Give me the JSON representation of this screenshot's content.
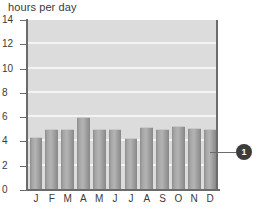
{
  "chart_data": {
    "type": "bar",
    "title": "hours per day",
    "xlabel": "",
    "ylabel": "",
    "categories": [
      "J",
      "F",
      "M",
      "A",
      "M",
      "J",
      "J",
      "A",
      "S",
      "O",
      "N",
      "D"
    ],
    "values": [
      4.4,
      5.0,
      5.0,
      6.0,
      5.0,
      5.0,
      4.3,
      5.2,
      5.0,
      5.3,
      5.1,
      5.0
    ],
    "ylim": [
      0,
      14
    ],
    "yticks": [
      0,
      2,
      4,
      6,
      8,
      10,
      12,
      14
    ],
    "ytick_labels": [
      "0",
      "2",
      "4",
      "6",
      "8",
      "10",
      "12",
      "14"
    ],
    "grid": true,
    "grid_orientation": "horizontal",
    "legend": null,
    "annotations": [
      {
        "name": "callout-badge",
        "label": "1",
        "target_category": "D",
        "description": "circular callout marker connected by a leader line to the December bar"
      }
    ],
    "colors": {
      "plot_background": "#dcdcdc",
      "gridline": "#f4f4f4",
      "bar": "#a5a5a5",
      "axis": "#6b6b6b",
      "text": "#3a3a3a",
      "callout": "#3c3c3c",
      "page_background": "#ffffff"
    }
  }
}
